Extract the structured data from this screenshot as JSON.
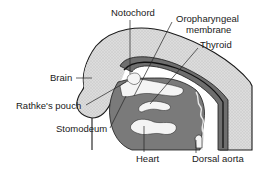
{
  "diagram": {
    "type": "anatomical cross-section",
    "labels": {
      "notochord": "Notochord",
      "oropharyngeal_1": "Oropharyngeal",
      "oropharyngeal_2": "membrane",
      "thyroid": "Thyroid",
      "brain": "Brain",
      "rathke": "Rathke's pouch",
      "stomodeum": "Stomodeum",
      "heart": "Heart",
      "dorsal_aorta": "Dorsal aorta"
    },
    "colors": {
      "background": "#ffffff",
      "outer_tissue": "#d6d6d6",
      "dark_layer": "#6e6e6e",
      "mid_layer": "#9a9a9a",
      "outline": "#1a1a1a",
      "cavity": "#f4f4f4"
    }
  }
}
